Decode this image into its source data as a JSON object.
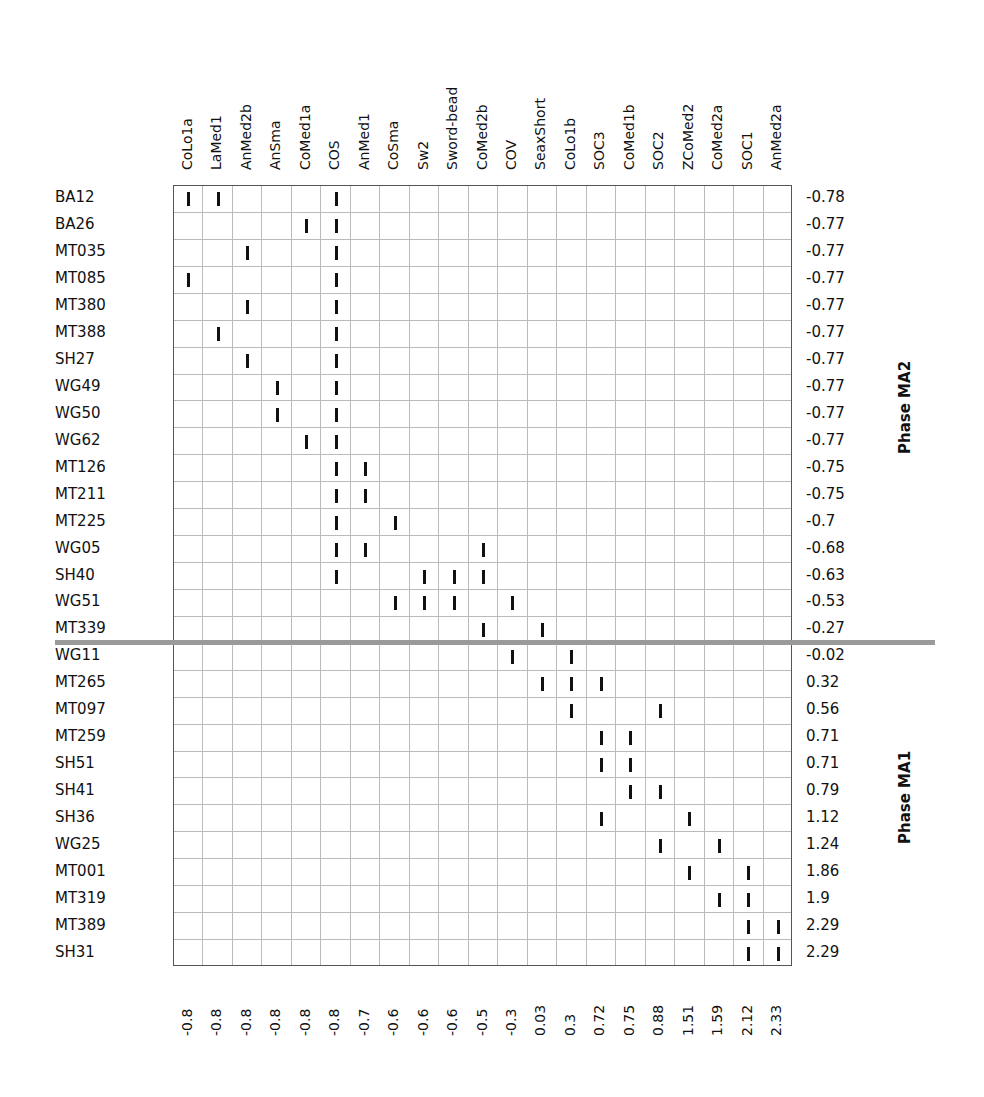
{
  "chart_data": {
    "type": "table",
    "columns": [
      "CoLo1a",
      "LaMed1",
      "AnMed2b",
      "AnSma",
      "CoMed1a",
      "COS",
      "AnMed1",
      "CoSma",
      "Sw2",
      "Sword-bead",
      "CoMed2b",
      "COV",
      "SeaxShort",
      "CoLo1b",
      "SOC3",
      "CoMed1b",
      "SOC2",
      "ZCoMed2",
      "CoMed2a",
      "SOC1",
      "AnMed2a"
    ],
    "column_scores": [
      "-0.8",
      "-0.8",
      "-0.8",
      "-0.8",
      "-0.8",
      "-0.8",
      "-0.7",
      "-0.6",
      "-0.6",
      "-0.6",
      "-0.5",
      "-0.3",
      "0.03",
      "0.3",
      "0.72",
      "0.75",
      "0.88",
      "1.51",
      "1.59",
      "2.12",
      "2.33"
    ],
    "rows": [
      {
        "label": "BA12",
        "score": "-0.78",
        "marks": [
          0,
          1,
          5
        ]
      },
      {
        "label": "BA26",
        "score": "-0.77",
        "marks": [
          4,
          5
        ]
      },
      {
        "label": "MT035",
        "score": "-0.77",
        "marks": [
          2,
          5
        ]
      },
      {
        "label": "MT085",
        "score": "-0.77",
        "marks": [
          0,
          5
        ]
      },
      {
        "label": "MT380",
        "score": "-0.77",
        "marks": [
          2,
          5
        ]
      },
      {
        "label": "MT388",
        "score": "-0.77",
        "marks": [
          1,
          5
        ]
      },
      {
        "label": "SH27",
        "score": "-0.77",
        "marks": [
          2,
          5
        ]
      },
      {
        "label": "WG49",
        "score": "-0.77",
        "marks": [
          3,
          5
        ]
      },
      {
        "label": "WG50",
        "score": "-0.77",
        "marks": [
          3,
          5
        ]
      },
      {
        "label": "WG62",
        "score": "-0.77",
        "marks": [
          4,
          5
        ]
      },
      {
        "label": "MT126",
        "score": "-0.75",
        "marks": [
          5,
          6
        ]
      },
      {
        "label": "MT211",
        "score": "-0.75",
        "marks": [
          5,
          6
        ]
      },
      {
        "label": "MT225",
        "score": "-0.7",
        "marks": [
          5,
          7
        ]
      },
      {
        "label": "WG05",
        "score": "-0.68",
        "marks": [
          5,
          6,
          10
        ]
      },
      {
        "label": "SH40",
        "score": "-0.63",
        "marks": [
          5,
          8,
          9,
          10
        ]
      },
      {
        "label": "WG51",
        "score": "-0.53",
        "marks": [
          7,
          8,
          9,
          11
        ]
      },
      {
        "label": "MT339",
        "score": "-0.27",
        "marks": [
          10,
          12
        ]
      },
      {
        "label": "WG11",
        "score": "-0.02",
        "marks": [
          11,
          13
        ]
      },
      {
        "label": "MT265",
        "score": "0.32",
        "marks": [
          12,
          13,
          14
        ]
      },
      {
        "label": "MT097",
        "score": "0.56",
        "marks": [
          13,
          16
        ]
      },
      {
        "label": "MT259",
        "score": "0.71",
        "marks": [
          14,
          15
        ]
      },
      {
        "label": "SH51",
        "score": "0.71",
        "marks": [
          14,
          15
        ]
      },
      {
        "label": "SH41",
        "score": "0.79",
        "marks": [
          15,
          16
        ]
      },
      {
        "label": "SH36",
        "score": "1.12",
        "marks": [
          14,
          17
        ]
      },
      {
        "label": "WG25",
        "score": "1.24",
        "marks": [
          16,
          18
        ]
      },
      {
        "label": "MT001",
        "score": "1.86",
        "marks": [
          17,
          19
        ]
      },
      {
        "label": "MT319",
        "score": "1.9",
        "marks": [
          18,
          19
        ]
      },
      {
        "label": "MT389",
        "score": "2.29",
        "marks": [
          19,
          20
        ]
      },
      {
        "label": "SH31",
        "score": "2.29",
        "marks": [
          19,
          20
        ]
      }
    ],
    "phases": [
      {
        "label": "Phase MA2",
        "rows_from": 0,
        "rows_to": 16
      },
      {
        "label": "Phase MA1",
        "rows_from": 17,
        "rows_to": 28
      }
    ],
    "divider_after_row": 16,
    "colors": {
      "mark": "#111111",
      "grid": "#bbbbbb",
      "border": "#555555",
      "divider": "#9a9a9a"
    }
  }
}
